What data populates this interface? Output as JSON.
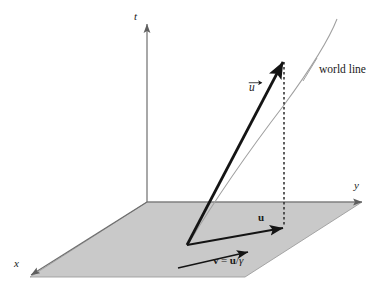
{
  "figure": {
    "background_color": "#ffffff",
    "width": 387,
    "height": 290
  },
  "colors": {
    "plane_fill": "#c9c9c9",
    "plane_edge": "#8a8a8a",
    "axis": "#6e6e6e",
    "vector": "#1a1a1a",
    "worldline": "#9a9a9a",
    "dashed": "#2b2b2b",
    "text": "#1a1a1a"
  },
  "axes": [
    {
      "name": "t-axis",
      "label": "t",
      "label_x": 136,
      "label_y": 11,
      "style": "italic",
      "from_x": 147,
      "from_y": 202,
      "to_x": 147,
      "to_y": 22
    },
    {
      "name": "y-axis",
      "label": "y",
      "label_x": 354,
      "label_y": 180,
      "style": "italic",
      "from_x": 147,
      "from_y": 202,
      "to_x": 366,
      "to_y": 202
    },
    {
      "name": "x-axis",
      "label": "x",
      "label_x": 14,
      "label_y": 258,
      "style": "italic",
      "from_x": 147,
      "from_y": 202,
      "to_x": 28,
      "to_y": 277
    }
  ],
  "plane": {
    "name": "xy-ground-plane",
    "points": "147,202 362,202 245,277 30,277"
  },
  "vectors": [
    {
      "name": "proper-velocity-vector",
      "label": "u",
      "label_accent": "vector-arrow",
      "label_x": 250,
      "label_y": 82,
      "from_x": 187,
      "from_y": 245,
      "to_x": 284,
      "to_y": 59,
      "width": 2.6
    },
    {
      "name": "coordinate-velocity-u-component",
      "label": "u",
      "label_x": 259,
      "label_y": 213,
      "from_x": 187,
      "from_y": 245,
      "to_x": 285,
      "to_y": 228,
      "width": 1.9
    },
    {
      "name": "velocity-v-vector",
      "label_parts": {
        "v": "v",
        "equals": "=",
        "u": "u",
        "slash": "/",
        "gamma": "γ"
      },
      "label_full": "v = u/γ",
      "label_x": 214,
      "label_y": 256,
      "from_x": 178,
      "from_y": 268,
      "to_x": 250,
      "to_y": 252,
      "width": 1.6
    }
  ],
  "worldline": {
    "name": "world-line-curve",
    "label": "world line",
    "label_x": 319,
    "label_y": 64,
    "path": "M 187,246 C 212,205 250,150 285,104 C 310,70 327,42 337,19",
    "leader_from_x": 302,
    "leader_from_y": 80,
    "leader_to_x": 316,
    "leader_to_y": 58
  },
  "dashed_drop_line": {
    "name": "projection-dashed-line",
    "from_x": 284,
    "from_y": 60,
    "to_x": 284,
    "to_y": 229,
    "dash": "2.5 2.5"
  }
}
